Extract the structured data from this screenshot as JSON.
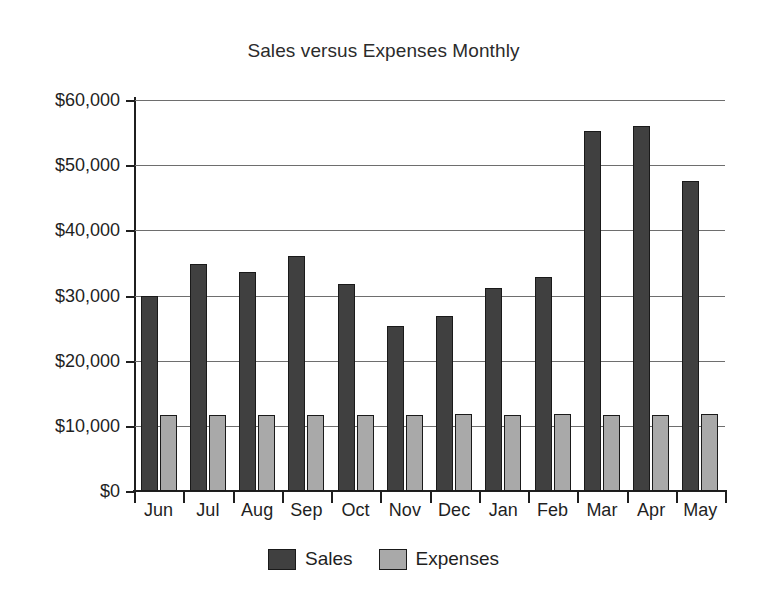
{
  "chart_data": {
    "type": "bar",
    "title": "Sales versus Expenses Monthly",
    "xlabel": "",
    "ylabel": "",
    "ylim": [
      0,
      60000
    ],
    "grid": true,
    "legend_position": "bottom",
    "categories": [
      "Jun",
      "Jul",
      "Aug",
      "Sep",
      "Oct",
      "Nov",
      "Dec",
      "Jan",
      "Feb",
      "Mar",
      "Apr",
      "May"
    ],
    "ytick_labels": [
      "$60,000",
      "$50,000",
      "$40,000",
      "$30,000",
      "$20,000",
      "$10,000",
      "$0"
    ],
    "ytick_values": [
      60000,
      50000,
      40000,
      30000,
      20000,
      10000,
      0
    ],
    "series": [
      {
        "name": "Sales",
        "color": "#404040",
        "values": [
          30000,
          34800,
          33600,
          36100,
          31700,
          25300,
          26800,
          31100,
          32900,
          55300,
          56000,
          47500
        ]
      },
      {
        "name": "Expenses",
        "color": "#a9a9a9",
        "values": [
          11700,
          11700,
          11700,
          11700,
          11700,
          11700,
          11800,
          11700,
          11800,
          11700,
          11700,
          11800
        ]
      }
    ]
  }
}
